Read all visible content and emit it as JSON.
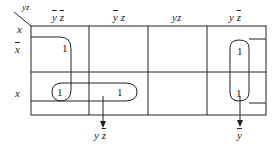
{
  "kmap": {
    "corner": {
      "top": "yz",
      "left": "x"
    },
    "columns": [
      {
        "label": "y z",
        "bars": "yz"
      },
      {
        "label": "y z",
        "bars": "y"
      },
      {
        "label": "yz",
        "bars": ""
      },
      {
        "label": "y z",
        "bars": "z"
      }
    ],
    "rows": [
      {
        "label": "x",
        "bar": true
      },
      {
        "label": "x",
        "bar": false
      }
    ],
    "cells": [
      [
        "1",
        "",
        "",
        "1"
      ],
      [
        "1",
        "1",
        "",
        "1"
      ]
    ],
    "groups": [
      {
        "name": "y-bar-z-bar-row-x",
        "term_label_parts": [
          "y",
          "z"
        ],
        "term": "y z̄"
      },
      {
        "name": "y-bar-wrap",
        "term": "ȳ"
      }
    ],
    "outputs": {
      "left_term": {
        "y": "y",
        "z": "z"
      },
      "right_term": {
        "y": "y"
      }
    },
    "colors": {
      "line": "#222222",
      "background": "#ffffff"
    }
  }
}
